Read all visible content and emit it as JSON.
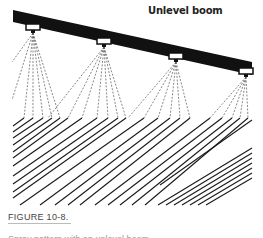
{
  "figure": {
    "title": "Unlevel boom",
    "caption": "FIGURE 10-8.",
    "caption_continuation": "Spray pattern with an unlevel boom",
    "nozzle_count": 4,
    "colors": {
      "boom": "#111111",
      "spray": "#555555",
      "deposit": "#1a1a1a"
    }
  }
}
